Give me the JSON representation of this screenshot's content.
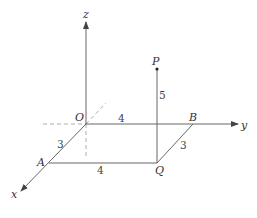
{
  "diagram": {
    "type": "3d-coordinate-axes",
    "axes": {
      "x": {
        "label": "x"
      },
      "y": {
        "label": "y"
      },
      "z": {
        "label": "z"
      }
    },
    "points": {
      "O": {
        "label": "O"
      },
      "A": {
        "label": "A"
      },
      "B": {
        "label": "B"
      },
      "Q": {
        "label": "Q"
      },
      "P": {
        "label": "P"
      }
    },
    "lengths": {
      "OA": "3",
      "OB": "4",
      "AQ": "4",
      "BQ": "3",
      "QP": "5"
    },
    "colors": {
      "line": "#555555",
      "dashed": "#999999",
      "text": "#333333"
    }
  }
}
